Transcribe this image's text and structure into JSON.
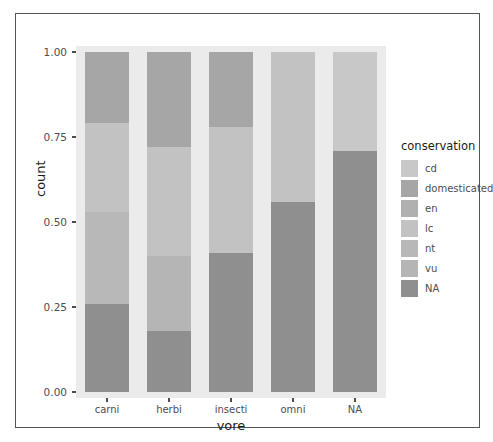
{
  "chart_data": {
    "type": "bar",
    "subtype": "stacked-proportional",
    "title": "",
    "xlabel": "vore",
    "ylabel": "count",
    "categories": [
      "carni",
      "herbi",
      "insecti",
      "omni",
      "NA"
    ],
    "ylim": [
      0,
      1
    ],
    "ytick_labels": [
      "0.00",
      "0.25",
      "0.50",
      "0.75",
      "1.00"
    ],
    "ytick_values": [
      0,
      0.25,
      0.5,
      0.75,
      1
    ],
    "grid": false,
    "legend_title": "conservation",
    "legend_position": "right",
    "legend_entries": [
      "cd",
      "domesticated",
      "en",
      "lc",
      "nt",
      "vu",
      "NA"
    ],
    "colors": {
      "cd": "#c8c8c8",
      "domesticated": "#a6a6a6",
      "en": "#b0b0b0",
      "lc": "#c2c2c2",
      "nt": "#b8b8b8",
      "vu": "#b5b5b5",
      "NA": "#8f8f8f",
      "panel_background": "#ebebeb",
      "axis_text": "#4d4d4d",
      "title_text": "#1a1a1a",
      "frame_border": "#555555"
    },
    "series": [
      {
        "name": "cd",
        "values": [
          0.0,
          0.0,
          0.0,
          0.0,
          0.0
        ]
      },
      {
        "name": "domesticated",
        "values": [
          0.21,
          0.28,
          0.22,
          0.0,
          0.0
        ]
      },
      {
        "name": "en",
        "values": [
          0.0,
          0.0,
          0.0,
          0.0,
          0.0
        ]
      },
      {
        "name": "lc",
        "values": [
          0.26,
          0.32,
          0.37,
          0.44,
          0.29
        ]
      },
      {
        "name": "nt",
        "values": [
          0.27,
          0.0,
          0.0,
          0.0,
          0.0
        ]
      },
      {
        "name": "vu",
        "values": [
          0.0,
          0.22,
          0.0,
          0.0,
          0.0
        ]
      },
      {
        "name": "NA",
        "values": [
          0.26,
          0.18,
          0.41,
          0.56,
          0.71
        ]
      }
    ],
    "bars": [
      {
        "category": "carni",
        "segments": [
          {
            "label": "domesticated",
            "y0": 0.79,
            "y1": 1.0,
            "color": "#a6a6a6"
          },
          {
            "label": "lc",
            "y0": 0.53,
            "y1": 0.79,
            "color": "#c2c2c2"
          },
          {
            "label": "nt",
            "y0": 0.26,
            "y1": 0.53,
            "color": "#b8b8b8"
          },
          {
            "label": "NA",
            "y0": 0.0,
            "y1": 0.26,
            "color": "#8f8f8f"
          }
        ]
      },
      {
        "category": "herbi",
        "segments": [
          {
            "label": "domesticated",
            "y0": 0.72,
            "y1": 1.0,
            "color": "#a6a6a6"
          },
          {
            "label": "lc",
            "y0": 0.4,
            "y1": 0.72,
            "color": "#c2c2c2"
          },
          {
            "label": "vu",
            "y0": 0.18,
            "y1": 0.4,
            "color": "#b5b5b5"
          },
          {
            "label": "NA",
            "y0": 0.0,
            "y1": 0.18,
            "color": "#8f8f8f"
          }
        ]
      },
      {
        "category": "insecti",
        "segments": [
          {
            "label": "domesticated",
            "y0": 0.78,
            "y1": 1.0,
            "color": "#a6a6a6"
          },
          {
            "label": "lc",
            "y0": 0.41,
            "y1": 0.78,
            "color": "#c2c2c2"
          },
          {
            "label": "NA",
            "y0": 0.0,
            "y1": 0.41,
            "color": "#8f8f8f"
          }
        ]
      },
      {
        "category": "omni",
        "segments": [
          {
            "label": "lc",
            "y0": 0.56,
            "y1": 1.0,
            "color": "#c2c2c2"
          },
          {
            "label": "NA",
            "y0": 0.0,
            "y1": 0.56,
            "color": "#8f8f8f"
          }
        ]
      },
      {
        "category": "NA",
        "segments": [
          {
            "label": "lc",
            "y0": 0.71,
            "y1": 1.0,
            "color": "#c8c8c8"
          },
          {
            "label": "NA",
            "y0": 0.0,
            "y1": 0.71,
            "color": "#8f8f8f"
          }
        ]
      }
    ]
  }
}
